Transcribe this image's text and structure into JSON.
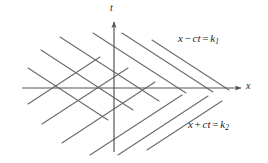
{
  "figure": {
    "width": 268,
    "height": 163,
    "background": "#ffffff",
    "line_color": "#6b6b6b",
    "axis_color": "#555555",
    "text_color": "#1a1a1a"
  },
  "axes": {
    "origin": {
      "x": 114,
      "y": 88
    },
    "horizontal": {
      "name": "x-axis",
      "label": "x",
      "x_start": 22,
      "x_end": 241,
      "y": 88,
      "arrow": "right"
    },
    "vertical": {
      "name": "t-axis",
      "label": "t",
      "y_start": 22,
      "y_end": 152,
      "x": 114,
      "arrow": "up"
    }
  },
  "labels": {
    "upper": {
      "lhs_var1": "x",
      "operator": "−",
      "lhs_var2": "ct",
      "equals": "=",
      "rhs": "k",
      "subscript": "1",
      "full_text": "x − ct = k₁"
    },
    "lower": {
      "lhs_var1": "x",
      "operator": "+",
      "lhs_var2": "ct",
      "equals": "=",
      "rhs": "k",
      "subscript": "2",
      "full_text": "x + ct = k₂"
    }
  },
  "chart_data": {
    "type": "line",
    "xlabel": "x",
    "ylabel": "t",
    "grid": false,
    "legend": "inline-annotations",
    "families": [
      {
        "name": "x - ct = k1",
        "description": "Descending family (negative screen slope), top-left to bottom-right",
        "slope": -0.65,
        "count": 6,
        "annotation": "x − ct = k₁",
        "lines": [
          {
            "x1": 28,
            "y1": 68,
            "x2": 108,
            "y2": 120
          },
          {
            "x1": 41,
            "y1": 50,
            "x2": 133,
            "y2": 110
          },
          {
            "x1": 60,
            "y1": 37,
            "x2": 159,
            "y2": 101
          },
          {
            "x1": 93,
            "y1": 33,
            "x2": 186,
            "y2": 93
          },
          {
            "x1": 122,
            "y1": 33,
            "x2": 213,
            "y2": 92
          },
          {
            "x1": 152,
            "y1": 40,
            "x2": 229,
            "y2": 90
          }
        ]
      },
      {
        "name": "x + ct = k2",
        "description": "Ascending family (positive screen slope), bottom-left to top-right",
        "slope": 0.65,
        "count": 6,
        "annotation": "x + ct = k₂",
        "lines": [
          {
            "x1": 28,
            "y1": 104,
            "x2": 100,
            "y2": 57
          },
          {
            "x1": 42,
            "y1": 124,
            "x2": 128,
            "y2": 68
          },
          {
            "x1": 62,
            "y1": 143,
            "x2": 155,
            "y2": 82
          },
          {
            "x1": 90,
            "y1": 155,
            "x2": 182,
            "y2": 95
          },
          {
            "x1": 118,
            "y1": 155,
            "x2": 208,
            "y2": 96
          },
          {
            "x1": 147,
            "y1": 150,
            "x2": 222,
            "y2": 101
          }
        ]
      }
    ]
  }
}
